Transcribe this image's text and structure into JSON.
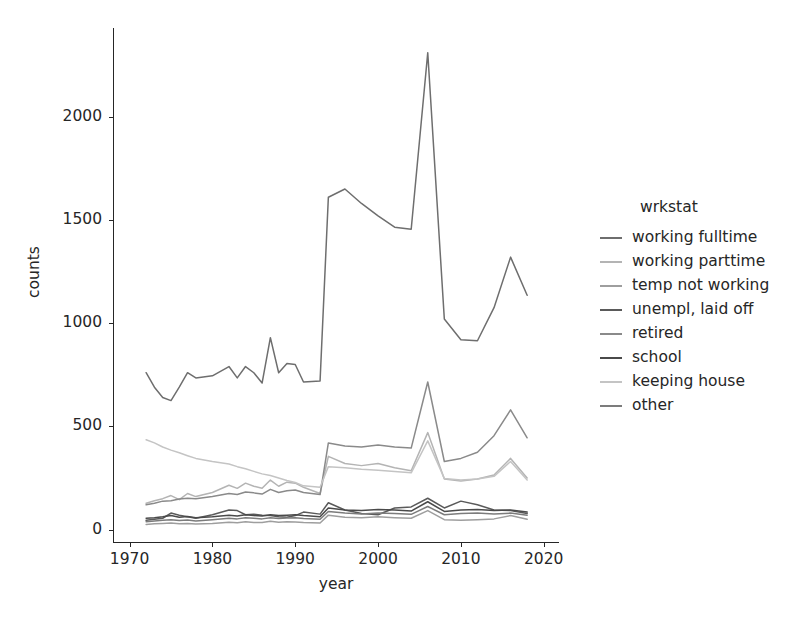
{
  "chart_data": {
    "type": "line",
    "title": "",
    "xlabel": "year",
    "ylabel": "counts",
    "xlim": [
      1968,
      2021
    ],
    "ylim": [
      -60,
      2430
    ],
    "xticks": [
      1970,
      1980,
      1990,
      2000,
      2010,
      2020
    ],
    "yticks": [
      0,
      500,
      1000,
      1500,
      2000
    ],
    "grid": false,
    "legend_title": "wrkstat",
    "legend_position": "right",
    "x": [
      1972,
      1973,
      1974,
      1975,
      1976,
      1977,
      1978,
      1980,
      1982,
      1983,
      1984,
      1985,
      1986,
      1987,
      1988,
      1989,
      1990,
      1991,
      1993,
      1994,
      1996,
      1998,
      2000,
      2002,
      2004,
      2006,
      2008,
      2010,
      2012,
      2014,
      2016,
      2018
    ],
    "series": [
      {
        "name": "working fulltime",
        "color": "#6e6e6e",
        "values": [
          760,
          690,
          640,
          625,
          690,
          760,
          735,
          745,
          790,
          735,
          790,
          760,
          710,
          930,
          760,
          805,
          800,
          715,
          720,
          1610,
          1650,
          1580,
          1520,
          1465,
          1455,
          2310,
          1020,
          920,
          915,
          1075,
          1320,
          1135
        ]
      },
      {
        "name": "working parttime",
        "color": "#b4b4b4",
        "values": [
          128,
          140,
          150,
          165,
          145,
          175,
          160,
          180,
          215,
          200,
          225,
          210,
          200,
          240,
          210,
          230,
          225,
          205,
          175,
          355,
          320,
          310,
          320,
          300,
          285,
          470,
          245,
          235,
          245,
          265,
          345,
          250
        ]
      },
      {
        "name": "temp not working",
        "color": "#9e9e9e",
        "values": [
          25,
          28,
          30,
          32,
          28,
          30,
          27,
          30,
          36,
          33,
          38,
          35,
          34,
          40,
          36,
          38,
          37,
          34,
          32,
          70,
          60,
          57,
          62,
          58,
          55,
          92,
          48,
          45,
          48,
          52,
          68,
          50
        ]
      },
      {
        "name": "unempl, laid off",
        "color": "#5a5a5a",
        "values": [
          45,
          50,
          55,
          80,
          70,
          62,
          55,
          72,
          95,
          92,
          72,
          75,
          70,
          68,
          62,
          60,
          68,
          85,
          75,
          130,
          95,
          78,
          72,
          105,
          110,
          152,
          105,
          138,
          120,
          95,
          92,
          78
        ]
      },
      {
        "name": "retired",
        "color": "#8a8a8a",
        "values": [
          120,
          128,
          138,
          140,
          148,
          152,
          150,
          160,
          175,
          170,
          182,
          178,
          172,
          195,
          180,
          188,
          192,
          180,
          170,
          420,
          405,
          400,
          410,
          400,
          395,
          715,
          330,
          345,
          375,
          455,
          580,
          445
        ]
      },
      {
        "name": "school",
        "color": "#4a4a4a",
        "values": [
          55,
          58,
          62,
          68,
          60,
          64,
          58,
          62,
          70,
          66,
          72,
          68,
          66,
          72,
          68,
          70,
          72,
          68,
          62,
          105,
          95,
          92,
          98,
          95,
          90,
          135,
          88,
          95,
          98,
          92,
          95,
          85
        ]
      },
      {
        "name": "keeping house",
        "color": "#c4c4c4",
        "values": [
          435,
          420,
          400,
          385,
          372,
          358,
          345,
          330,
          318,
          305,
          295,
          282,
          270,
          262,
          250,
          238,
          228,
          212,
          205,
          305,
          300,
          292,
          288,
          282,
          275,
          430,
          248,
          240,
          245,
          258,
          330,
          240
        ]
      },
      {
        "name": "other",
        "color": "#7c7c7c",
        "values": [
          38,
          42,
          45,
          48,
          44,
          46,
          42,
          48,
          55,
          52,
          58,
          55,
          52,
          58,
          54,
          56,
          58,
          54,
          50,
          88,
          80,
          76,
          80,
          78,
          74,
          112,
          72,
          78,
          80,
          76,
          80,
          70
        ]
      }
    ]
  },
  "axes": {
    "ylabel": "counts",
    "xlabel": "year",
    "ytick_labels": [
      "0",
      "500",
      "1000",
      "1500",
      "2000"
    ],
    "xtick_labels": [
      "1970",
      "1980",
      "1990",
      "2000",
      "2010",
      "2020"
    ]
  },
  "legend": {
    "title": "wrkstat",
    "items": [
      {
        "label": "working fulltime",
        "color": "#6e6e6e"
      },
      {
        "label": "working parttime",
        "color": "#b4b4b4"
      },
      {
        "label": "temp not working",
        "color": "#9e9e9e"
      },
      {
        "label": "unempl, laid off",
        "color": "#5a5a5a"
      },
      {
        "label": "retired",
        "color": "#8a8a8a"
      },
      {
        "label": "school",
        "color": "#4a4a4a"
      },
      {
        "label": "keeping house",
        "color": "#c4c4c4"
      },
      {
        "label": "other",
        "color": "#7c7c7c"
      }
    ]
  }
}
